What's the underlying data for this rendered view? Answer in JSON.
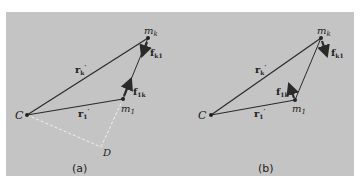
{
  "figure": {
    "panel_a": {
      "caption": "(a)",
      "points": {
        "C": "C",
        "m1": "m",
        "m1_sub": "1",
        "mk": "m",
        "mk_sub": "k",
        "D": "D"
      },
      "vectors": {
        "r1": "r",
        "r1_sub": "1",
        "r1_prime": "′",
        "rk": "r",
        "rk_sub": "k",
        "rk_prime": "′",
        "f1k": "f",
        "f1k_sub": "1k",
        "fk1": "f",
        "fk1_sub": "k1"
      }
    },
    "panel_b": {
      "caption": "(b)",
      "points": {
        "C": "C",
        "m1": "m",
        "m1_sub": "1",
        "mk": "m",
        "mk_sub": "k"
      },
      "vectors": {
        "r1": "r",
        "r1_sub": "1",
        "r1_prime": "′",
        "rk": "r",
        "rk_sub": "k",
        "rk_prime": "′",
        "f1k": "f",
        "f1k_sub": "1k",
        "fk1": "f",
        "fk1_sub": "k1"
      }
    },
    "colors": {
      "background": "#c4c4c4",
      "line": "#2a2a2a",
      "dashed": "#f0f0f0"
    }
  }
}
